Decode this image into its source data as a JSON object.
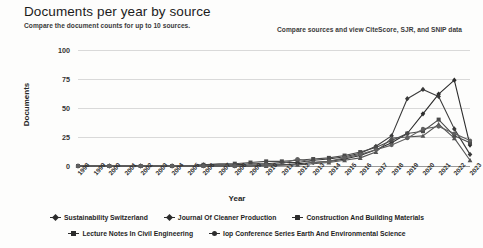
{
  "header": {
    "title": "Documents per year by source",
    "subtitle": "Compare the document counts for up to 10 sources.",
    "right_link": "Compare sources and view CiteScore, SJR, and SNIP data"
  },
  "chart_data": {
    "type": "line",
    "title": "Documents per year by source",
    "xlabel": "Year",
    "ylabel": "Documents",
    "ylim": [
      0,
      100
    ],
    "yticks": [
      0,
      25,
      50,
      75,
      100
    ],
    "grid": true,
    "legend_position": "bottom",
    "categories": [
      "1998",
      "1999",
      "2000",
      "2001",
      "2002",
      "2003",
      "2004",
      "2005",
      "2006",
      "2007",
      "2008",
      "2009",
      "2010",
      "2011",
      "2012",
      "2013",
      "2014",
      "2015",
      "2016",
      "2017",
      "2018",
      "2019",
      "2020",
      "2021",
      "2022",
      "2023"
    ],
    "series": [
      {
        "name": "Sustainability Switzerland",
        "marker": "diamond",
        "color": "#2c2c2c",
        "values": [
          0,
          0,
          0,
          0,
          0,
          0,
          0,
          0,
          0,
          0,
          0,
          0,
          1,
          1,
          2,
          3,
          4,
          6,
          9,
          14,
          20,
          28,
          45,
          62,
          74,
          18
        ]
      },
      {
        "name": "Journal Of Cleaner Production",
        "marker": "diamond",
        "color": "#3a3a3a",
        "values": [
          0,
          0,
          0,
          0,
          0,
          0,
          0,
          0,
          1,
          1,
          1,
          2,
          2,
          3,
          3,
          5,
          6,
          8,
          11,
          17,
          26,
          58,
          66,
          60,
          32,
          10
        ]
      },
      {
        "name": "Construction And Building Materials",
        "marker": "square",
        "color": "#4a4a4a",
        "values": [
          0,
          0,
          0,
          0,
          0,
          0,
          0,
          0,
          1,
          2,
          2,
          3,
          4,
          4,
          5,
          6,
          7,
          9,
          12,
          16,
          22,
          28,
          30,
          40,
          26,
          20
        ]
      },
      {
        "name": "Lecture Notes In Civil Engineering",
        "marker": "triangle",
        "color": "#555555",
        "values": [
          0,
          0,
          0,
          0,
          0,
          0,
          0,
          0,
          0,
          0,
          0,
          0,
          0,
          1,
          1,
          2,
          3,
          5,
          7,
          12,
          24,
          25,
          26,
          36,
          24,
          5
        ]
      },
      {
        "name": "Iop Conference Series Earth And Environmental Science",
        "marker": "circle",
        "color": "#606060",
        "values": [
          0,
          0,
          0,
          0,
          0,
          0,
          0,
          0,
          0,
          0,
          0,
          1,
          1,
          2,
          6,
          3,
          4,
          7,
          10,
          14,
          18,
          24,
          32,
          34,
          28,
          22
        ]
      }
    ]
  },
  "legend": {
    "rows": [
      [
        {
          "label": "Sustainability Switzerland",
          "marker": "diamond"
        },
        {
          "label": "Journal Of Cleaner Production",
          "marker": "diamond"
        },
        {
          "label": "Construction And Building Materials",
          "marker": "square"
        }
      ],
      [
        {
          "label": "Lecture Notes In Civil Engineering",
          "marker": "triangle"
        },
        {
          "label": "Iop Conference Series Earth And Environmental Science",
          "marker": "circle"
        }
      ]
    ]
  }
}
